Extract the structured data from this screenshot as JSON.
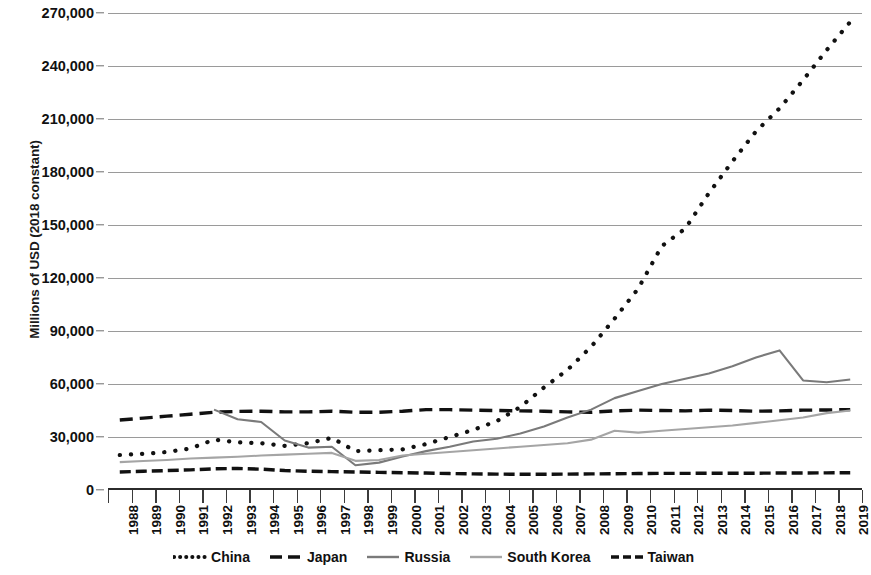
{
  "chart_data": {
    "type": "line",
    "title": "",
    "xlabel": "",
    "ylabel": "Millions of USD (2018 constant)",
    "ylim": [
      0,
      270000
    ],
    "ytick_values": [
      0,
      30000,
      60000,
      90000,
      120000,
      150000,
      180000,
      210000,
      240000,
      270000
    ],
    "ytick_labels": [
      "0",
      "30,000",
      "60,000",
      "90,000",
      "120,000",
      "150,000",
      "180,000",
      "210,000",
      "240,000",
      "270,000"
    ],
    "grid": true,
    "legend_position": "bottom",
    "categories": [
      "1988",
      "1989",
      "1990",
      "1991",
      "1992",
      "1993",
      "1994",
      "1995",
      "1996",
      "1997",
      "1998",
      "1999",
      "2000",
      "2001",
      "2002",
      "2003",
      "2004",
      "2005",
      "2006",
      "2007",
      "2008",
      "2009",
      "2010",
      "2011",
      "2012",
      "2013",
      "2014",
      "2015",
      "2016",
      "2017",
      "2018",
      "2019"
    ],
    "series": [
      {
        "name": "China",
        "color": "#111111",
        "style": "dotted",
        "values": [
          19800,
          20500,
          21500,
          23500,
          28500,
          27000,
          26500,
          25000,
          26500,
          29500,
          22000,
          22500,
          23000,
          26000,
          30000,
          34000,
          39000,
          47000,
          58000,
          68000,
          81000,
          97000,
          114000,
          138000,
          148000,
          168000,
          186000,
          203000,
          216000,
          232000,
          249000,
          265000
        ]
      },
      {
        "name": "Japan",
        "color": "#111111",
        "style": "dashed",
        "values": [
          39600,
          40700,
          41800,
          42900,
          44000,
          44500,
          44600,
          44200,
          44200,
          44600,
          44000,
          44000,
          44600,
          45500,
          45500,
          45200,
          45000,
          44800,
          44600,
          44200,
          44000,
          44800,
          45200,
          45000,
          44800,
          45200,
          45000,
          44600,
          44800,
          45200,
          45300,
          45500
        ]
      },
      {
        "name": "Russia",
        "color": "#7a7a7a",
        "style": "solid",
        "values": [
          null,
          null,
          null,
          null,
          45500,
          40000,
          38500,
          28000,
          24000,
          24500,
          14000,
          15500,
          19000,
          22000,
          24500,
          27500,
          29000,
          32000,
          36000,
          41000,
          45500,
          52000,
          56000,
          60000,
          63000,
          66000,
          70000,
          75000,
          79000,
          62000,
          61000,
          62500
        ]
      },
      {
        "name": "South Korea",
        "color": "#a5a5a5",
        "style": "solid",
        "values": [
          15800,
          16400,
          17000,
          17800,
          18300,
          18800,
          19500,
          20000,
          20500,
          21000,
          16500,
          17000,
          19500,
          20500,
          21500,
          22500,
          23500,
          24500,
          25500,
          26500,
          28500,
          33500,
          32500,
          33500,
          34500,
          35500,
          36500,
          38000,
          39500,
          41000,
          43500,
          45000
        ]
      },
      {
        "name": "Taiwan",
        "color": "#111111",
        "style": "dashdot",
        "values": [
          10200,
          10600,
          11000,
          11400,
          12000,
          12200,
          11800,
          11000,
          10600,
          10400,
          10200,
          10000,
          9800,
          9600,
          9300,
          9100,
          9000,
          8900,
          8900,
          9000,
          9100,
          9200,
          9300,
          9400,
          9400,
          9500,
          9500,
          9500,
          9600,
          9600,
          9700,
          9800
        ]
      }
    ]
  },
  "legend": {
    "items": [
      {
        "label": "China",
        "style": "dotted",
        "color": "#111111"
      },
      {
        "label": "Japan",
        "style": "dashed",
        "color": "#111111"
      },
      {
        "label": "Russia",
        "style": "solid",
        "color": "#7a7a7a"
      },
      {
        "label": "South Korea",
        "style": "solid",
        "color": "#a5a5a5"
      },
      {
        "label": "Taiwan",
        "style": "dashdot",
        "color": "#111111"
      }
    ]
  }
}
